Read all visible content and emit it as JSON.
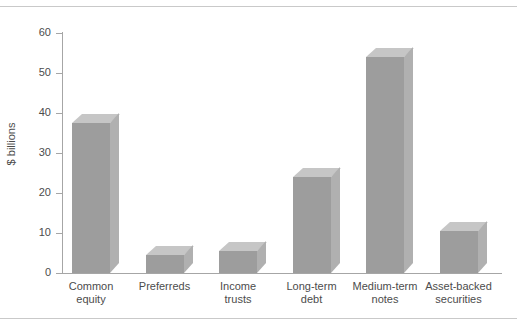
{
  "chart_data": {
    "type": "bar",
    "title": "",
    "subtitle": "",
    "xlabel": "",
    "ylabel": "$ billions",
    "ylim": [
      0,
      60
    ],
    "grid": false,
    "legend": "none",
    "style": "3d-bars-grayscale",
    "categories": [
      "Common equity",
      "Preferreds",
      "Income trusts",
      "Long-term debt",
      "Medium-term notes",
      "Asset-backed securities"
    ],
    "category_lines": [
      [
        "Common",
        "equity"
      ],
      [
        "Preferreds",
        ""
      ],
      [
        "Income",
        "trusts"
      ],
      [
        "Long-term",
        "debt"
      ],
      [
        "Medium-term",
        "notes"
      ],
      [
        "Asset-backed",
        "securities"
      ]
    ],
    "values": [
      37.5,
      4.5,
      5.5,
      24,
      54,
      10.5
    ],
    "y_ticks": [
      0,
      10,
      20,
      30,
      40,
      50,
      60
    ],
    "y_tick_labels": [
      "0",
      "10",
      "20",
      "30",
      "40",
      "50",
      "60"
    ],
    "colors": {
      "bar_front": "#9d9d9d",
      "bar_top": "#c6c6c6",
      "bar_side": "#b0b0b0",
      "axis": "#a6a6a6",
      "text": "#4c4c4c",
      "background": "#ffffff",
      "rule": "#c9c9c9"
    }
  }
}
